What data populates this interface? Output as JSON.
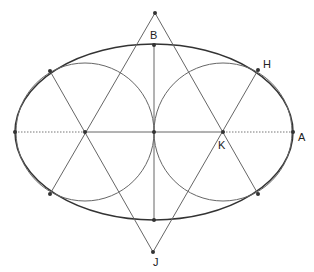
{
  "diagram": {
    "labels": {
      "B": "B",
      "H": "H",
      "A": "A",
      "K": "K",
      "J": "J"
    },
    "colors": {
      "ellipse": "#333333",
      "circle": "#555555",
      "line": "#555555",
      "point": "#333333",
      "dotted_axis": "#666666"
    }
  }
}
